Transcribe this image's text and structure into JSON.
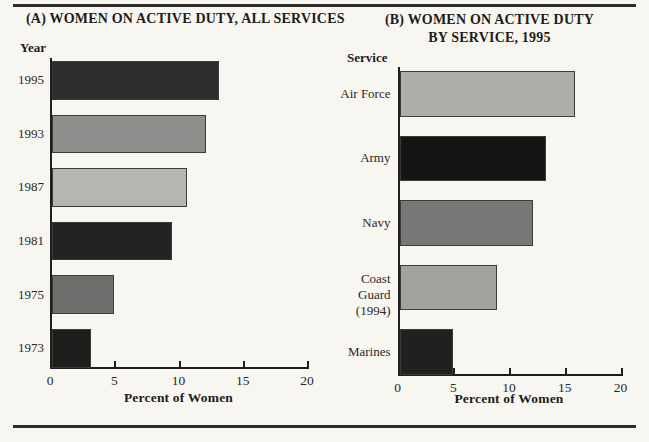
{
  "page": {
    "background": "#f8f6f0",
    "rule_color": "#2f2d2a"
  },
  "chart_data": [
    {
      "type": "bar",
      "orientation": "horizontal",
      "panel": "A",
      "title": "(A) WOMEN ON ACTIVE DUTY, ALL SERVICES",
      "category_axis_label": "Year",
      "value_axis_label": "Percent of Women",
      "categories": [
        "1995",
        "1993",
        "1987",
        "1981",
        "1975",
        "1973"
      ],
      "values": [
        13.0,
        12.0,
        10.5,
        9.3,
        4.8,
        3.0
      ],
      "bar_colors": [
        "#2e2c2c",
        "#8f8e8c",
        "#b6b5b2",
        "#232121",
        "#6f6e6c",
        "#1e1d1c"
      ],
      "xlim": [
        0,
        20
      ],
      "xticks": [
        0,
        5,
        10,
        15,
        20
      ],
      "grid": false,
      "legend": "none"
    },
    {
      "type": "bar",
      "orientation": "horizontal",
      "panel": "B",
      "title": "(B) WOMEN ON ACTIVE DUTY BY SERVICE, 1995",
      "title_lines": [
        "(B)  WOMEN ON ACTIVE DUTY",
        "BY SERVICE, 1995"
      ],
      "category_axis_label": "Service",
      "value_axis_label": "Percent of Women",
      "categories": [
        "Air Force",
        "Army",
        "Navy",
        "Coast Guard\n(1994)",
        "Marines"
      ],
      "values": [
        15.7,
        13.1,
        12.0,
        8.7,
        4.8
      ],
      "bar_colors": [
        "#aeadaa",
        "#161514",
        "#787775",
        "#a3a29f",
        "#21201f"
      ],
      "xlim": [
        0,
        20
      ],
      "xticks": [
        0,
        5,
        10,
        15,
        20
      ],
      "grid": false,
      "legend": "none"
    }
  ]
}
